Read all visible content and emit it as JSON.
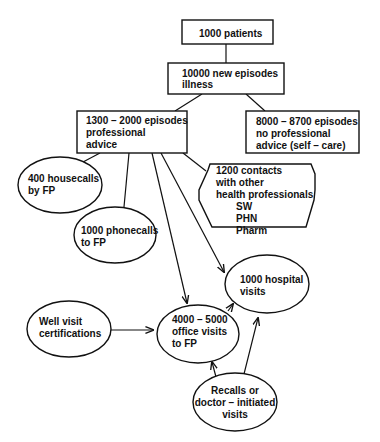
{
  "diagram": {
    "type": "flowchart",
    "nodes": [
      {
        "id": "patients",
        "shape": "rectangle",
        "lines": [
          "1000 patients"
        ]
      },
      {
        "id": "new_episodes",
        "shape": "rectangle",
        "lines": [
          "10000 new episodes",
          "illness"
        ]
      },
      {
        "id": "professional_advice",
        "shape": "rectangle",
        "lines": [
          "1300 – 2000 episodes",
          "professional",
          "advice"
        ]
      },
      {
        "id": "self_care",
        "shape": "rectangle",
        "lines": [
          "8000 – 8700 episodes",
          "no professional",
          "advice (self – care)"
        ]
      },
      {
        "id": "housecalls",
        "shape": "ellipse",
        "lines": [
          "400 housecalls",
          "by FP"
        ]
      },
      {
        "id": "phonecalls",
        "shape": "ellipse",
        "lines": [
          "1000 phonecalls",
          "to FP"
        ]
      },
      {
        "id": "other_professionals",
        "shape": "hexagon",
        "lines": [
          "1200 contacts",
          "with other",
          "health professionals",
          "SW",
          "PHN",
          "Pharm"
        ]
      },
      {
        "id": "hospital_visits",
        "shape": "ellipse",
        "lines": [
          "1000 hospital",
          "visits"
        ]
      },
      {
        "id": "well_visit",
        "shape": "ellipse",
        "lines": [
          "Well visit",
          "certifications"
        ]
      },
      {
        "id": "office_visits",
        "shape": "ellipse",
        "lines": [
          "4000 – 5000",
          "office visits",
          "to FP"
        ]
      },
      {
        "id": "recalls",
        "shape": "ellipse",
        "lines": [
          "Recalls or",
          "doctor – initiated",
          "visits"
        ]
      }
    ],
    "edges": [
      {
        "from": "patients",
        "to": "new_episodes",
        "arrow": false
      },
      {
        "from": "new_episodes",
        "to": "professional_advice",
        "arrow": false
      },
      {
        "from": "new_episodes",
        "to": "self_care",
        "arrow": false
      },
      {
        "from": "professional_advice",
        "to": "housecalls",
        "arrow": false
      },
      {
        "from": "professional_advice",
        "to": "phonecalls",
        "arrow": false
      },
      {
        "from": "professional_advice",
        "to": "other_professionals",
        "arrow": false
      },
      {
        "from": "professional_advice",
        "to": "office_visits",
        "arrow": true
      },
      {
        "from": "professional_advice",
        "to": "hospital_visits",
        "arrow": true
      },
      {
        "from": "well_visit",
        "to": "office_visits",
        "arrow": true
      },
      {
        "from": "office_visits",
        "to": "hospital_visits",
        "arrow": true
      },
      {
        "from": "recalls",
        "to": "office_visits",
        "arrow": true
      },
      {
        "from": "recalls",
        "to": "hospital_visits",
        "arrow": true
      }
    ]
  }
}
